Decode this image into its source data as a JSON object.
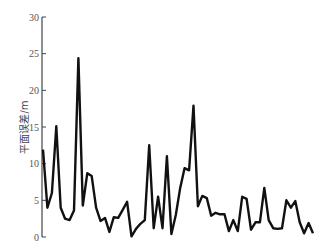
{
  "chart_data": {
    "type": "line",
    "title": "",
    "xlabel": "",
    "ylabel": "平面误差/m",
    "ylim": [
      0,
      30
    ],
    "yticks": [
      0,
      5,
      10,
      15,
      20,
      25,
      30
    ],
    "grid": false,
    "legend": null,
    "series": [
      {
        "name": "平面误差",
        "color": "#111111",
        "values": [
          11.9,
          4.0,
          6.0,
          15.1,
          4.0,
          2.5,
          2.3,
          3.6,
          24.4,
          4.3,
          8.7,
          8.3,
          4.0,
          2.2,
          2.6,
          0.7,
          2.7,
          2.6,
          3.7,
          4.8,
          0.1,
          1.1,
          1.8,
          2.3,
          12.5,
          1.2,
          5.5,
          1.2,
          11.0,
          0.4,
          3.0,
          6.7,
          9.4,
          9.1,
          17.9,
          4.2,
          5.6,
          5.3,
          2.9,
          3.3,
          3.1,
          3.1,
          0.8,
          2.3,
          0.8,
          5.5,
          5.2,
          1.0,
          2.0,
          2.0,
          6.7,
          2.3,
          1.2,
          1.1,
          1.2,
          5.0,
          4.0,
          4.9,
          2.0,
          0.5,
          1.9,
          0.5
        ]
      }
    ]
  }
}
